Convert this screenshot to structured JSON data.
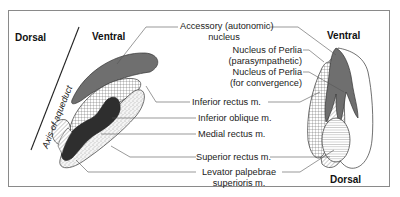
{
  "orientation": {
    "left_dorsal": "Dorsal",
    "left_ventral": "Ventral",
    "right_ventral": "Ventral",
    "right_dorsal": "Dorsal",
    "axis_label": "Axis of aqueduct"
  },
  "labels": {
    "accessory_line1": "Accessory (autonomic)",
    "accessory_line2": "nucleus",
    "perlia_para_line1": "Nucleus of Perlia",
    "perlia_para_line2": "(parasympathetic)",
    "perlia_conv_line1": "Nucleus of Perlia",
    "perlia_conv_line2": "(for convergence)",
    "inferior_rectus": "Inferior rectus m.",
    "inferior_oblique": "Inferior oblique m.",
    "medial_rectus": "Medial rectus m.",
    "superior_rectus": "Superior rectus m.",
    "levator_line1": "Levator palpebrae",
    "levator_line2": "superioris m."
  },
  "colors": {
    "frame": "#8a8a8a",
    "accessory_fill": "#6f6f6f",
    "medial_fill": "#2e2e2e",
    "leader": "#555555"
  }
}
